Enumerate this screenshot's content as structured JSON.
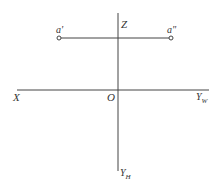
{
  "diagram": {
    "type": "orthographic-projection-axes",
    "colors": {
      "line": "#444444",
      "text": "#333333",
      "background": "#ffffff"
    },
    "axes": {
      "z_label": "Z",
      "x_label": "X",
      "origin_label": "O",
      "yw_label": "Y",
      "yw_sub": "W",
      "yh_label": "Y",
      "yh_sub": "H"
    },
    "points": {
      "front": {
        "label": "a'"
      },
      "side": {
        "label": "a\""
      }
    }
  }
}
